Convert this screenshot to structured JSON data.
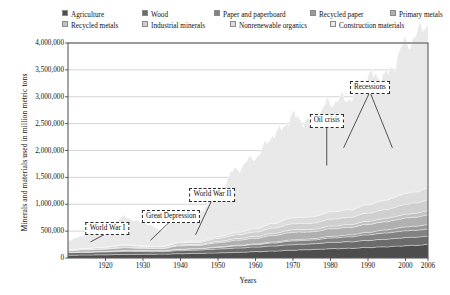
{
  "chart_data": {
    "type": "area",
    "stacked": true,
    "title": "",
    "subtitle": "",
    "xlabel": "Years",
    "ylabel": "Minerals and materials used in million metric tons",
    "xlim": [
      1910,
      2006
    ],
    "ylim": [
      0,
      4000000
    ],
    "xticks": [
      "1920",
      "1930",
      "1940",
      "1950",
      "1960",
      "1970",
      "1980",
      "1990",
      "2000",
      "2006"
    ],
    "xtick_values": [
      1920,
      1930,
      1940,
      1950,
      1960,
      1970,
      1980,
      1990,
      2000,
      2006
    ],
    "yticks": [
      "0",
      "500,000",
      "1,000,000",
      "1,500,000",
      "2,000,000",
      "2,500,000",
      "3,000,000",
      "3,500,000",
      "4,000,000"
    ],
    "ytick_values": [
      0,
      500000,
      1000000,
      1500000,
      2000000,
      2500000,
      3000000,
      3500000,
      4000000
    ],
    "grid": true,
    "grid_axis": "y",
    "legend_position": "top",
    "x": [
      1910,
      1915,
      1920,
      1925,
      1930,
      1935,
      1940,
      1945,
      1950,
      1955,
      1960,
      1965,
      1970,
      1975,
      1980,
      1985,
      1990,
      1995,
      2000,
      2003,
      2006
    ],
    "series": [
      {
        "name": "Agriculture",
        "color": "#4d4d4d",
        "values": [
          52000,
          56000,
          60000,
          66000,
          70000,
          72000,
          80000,
          86000,
          95000,
          105000,
          118000,
          130000,
          145000,
          158000,
          172000,
          180000,
          195000,
          210000,
          228000,
          238000,
          248000
        ]
      },
      {
        "name": "Wood",
        "color": "#6b6b6b",
        "values": [
          48000,
          50000,
          52000,
          56000,
          50000,
          46000,
          58000,
          62000,
          72000,
          80000,
          86000,
          95000,
          105000,
          105000,
          118000,
          122000,
          132000,
          140000,
          150000,
          152000,
          155000
        ]
      },
      {
        "name": "Paper and paperboard",
        "color": "#828282",
        "values": [
          4000,
          6000,
          9000,
          13000,
          15000,
          15000,
          20000,
          22000,
          30000,
          38000,
          45000,
          56000,
          68000,
          70000,
          82000,
          92000,
          105000,
          118000,
          128000,
          128000,
          132000
        ]
      },
      {
        "name": "Recycled paper",
        "color": "#9a9a9a",
        "values": [
          1500,
          2000,
          3000,
          4000,
          5000,
          5000,
          7000,
          8000,
          10000,
          12000,
          14000,
          17000,
          21000,
          24000,
          30000,
          36000,
          45000,
          58000,
          70000,
          76000,
          82000
        ]
      },
      {
        "name": "Primary metals",
        "color": "#b0b0b0",
        "values": [
          30000,
          38000,
          42000,
          52000,
          40000,
          38000,
          62000,
          58000,
          78000,
          95000,
          105000,
          125000,
          140000,
          130000,
          140000,
          138000,
          150000,
          152000,
          165000,
          170000,
          178000
        ]
      },
      {
        "name": "Recycled metals",
        "color": "#c2c2c2",
        "values": [
          6000,
          8000,
          10000,
          14000,
          11000,
          10000,
          18000,
          17000,
          24000,
          30000,
          34000,
          40000,
          46000,
          44000,
          50000,
          52000,
          58000,
          62000,
          70000,
          74000,
          78000
        ]
      },
      {
        "name": "Industrial minerals",
        "color": "#cfcfcf",
        "values": [
          14000,
          18000,
          24000,
          32000,
          26000,
          24000,
          38000,
          40000,
          55000,
          70000,
          82000,
          98000,
          115000,
          115000,
          130000,
          135000,
          150000,
          165000,
          185000,
          192000,
          200000
        ]
      },
      {
        "name": "Nonrenewable organics",
        "color": "#dcdcdc",
        "values": [
          2000,
          3000,
          5000,
          9000,
          10000,
          10000,
          16000,
          20000,
          32000,
          48000,
          62000,
          85000,
          110000,
          118000,
          135000,
          140000,
          158000,
          178000,
          200000,
          208000,
          218000
        ]
      },
      {
        "name": "Construction materials",
        "color": "#e9e9e9",
        "values": [
          180000,
          250000,
          330000,
          520000,
          430000,
          300000,
          560000,
          520000,
          860000,
          1180000,
          1340000,
          1650000,
          1880000,
          1760000,
          2050000,
          2090000,
          2380000,
          2320000,
          2780000,
          2920000,
          3100000
        ]
      }
    ],
    "annotations": [
      {
        "label": "World War I",
        "x": 1916,
        "box_x": 1920.5,
        "box_y": 560000,
        "leader_to_y": 300000
      },
      {
        "label": "Great Depression",
        "x": 1932,
        "box_x": 1937.5,
        "box_y": 790000,
        "leader_to_y": 330000
      },
      {
        "label": "World War II",
        "x": 1944,
        "box_x": 1948.5,
        "box_y": 1190000,
        "leader_to_y": 430000
      },
      {
        "label": "Oil crisis",
        "x": 1979,
        "box_x": 1979.0,
        "box_y": 2560000,
        "leader_to_y": 1720000
      },
      {
        "label": "Recessions",
        "x": 1991,
        "box_x": 1990.5,
        "box_y": 3185000,
        "leader_to_y": 2050000
      }
    ]
  },
  "legend": {
    "rows": [
      [
        {
          "label": "Agriculture",
          "color": "#4d4d4d",
          "x": 0
        },
        {
          "label": "Wood",
          "color": "#6b6b6b",
          "x": 80
        },
        {
          "label": "Paper and paperboard",
          "color": "#828282",
          "x": 152
        },
        {
          "label": "Recycled paper",
          "color": "#9a9a9a",
          "x": 248
        },
        {
          "label": "Primary metals",
          "color": "#b0b0b0",
          "x": 328
        }
      ],
      [
        {
          "label": "Recycled metals",
          "color": "#c2c2c2",
          "x": 0
        },
        {
          "label": "Industrial minerals",
          "color": "#cfcfcf",
          "x": 80
        },
        {
          "label": "Nonrenewable organics",
          "color": "#dcdcdc",
          "x": 168
        },
        {
          "label": "Construction materials",
          "color": "#e9e9e9",
          "x": 268
        }
      ]
    ]
  }
}
